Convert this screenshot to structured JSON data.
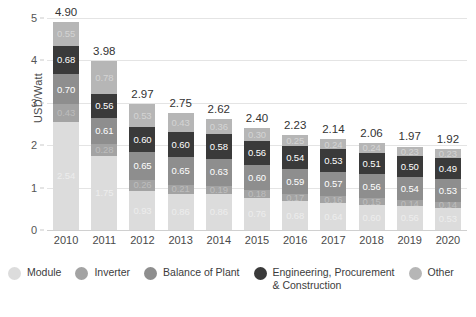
{
  "chart_data": {
    "type": "bar",
    "subtype": "stacked-bar",
    "title": "",
    "xlabel": "",
    "ylabel": "USD/Watt",
    "ylim": [
      0,
      5
    ],
    "yticks": [
      0,
      1,
      2,
      3,
      4,
      5
    ],
    "grid": true,
    "legend_position": "bottom",
    "categories": [
      "2010",
      "2011",
      "2012",
      "2013",
      "2014",
      "2015",
      "2016",
      "2017",
      "2018",
      "2019",
      "2020"
    ],
    "series": [
      {
        "name": "Module",
        "color": "#dcdcdc",
        "values": [
          2.54,
          1.75,
          0.93,
          0.86,
          0.86,
          0.76,
          0.68,
          0.64,
          0.6,
          0.56,
          0.53
        ]
      },
      {
        "name": "Inverter",
        "color": "#a3a3a3",
        "values": [
          0.43,
          0.28,
          0.26,
          0.21,
          0.19,
          0.18,
          0.17,
          0.16,
          0.15,
          0.14,
          0.14
        ]
      },
      {
        "name": "Balance of Plant",
        "color": "#8e8e8e",
        "values": [
          0.7,
          0.61,
          0.65,
          0.65,
          0.63,
          0.6,
          0.59,
          0.57,
          0.56,
          0.54,
          0.53
        ]
      },
      {
        "name": "Engineering, Procurement\n& Construction",
        "color": "#3a3a3a",
        "values": [
          0.68,
          0.56,
          0.6,
          0.6,
          0.58,
          0.56,
          0.54,
          0.53,
          0.51,
          0.5,
          0.49
        ]
      },
      {
        "name": "Other",
        "color": "#b6b6b6",
        "values": [
          0.55,
          0.78,
          0.53,
          0.43,
          0.36,
          0.3,
          0.25,
          0.24,
          0.24,
          0.23,
          0.23
        ]
      }
    ],
    "totals": [
      4.9,
      3.98,
      2.97,
      2.75,
      2.62,
      2.4,
      2.23,
      2.14,
      2.06,
      1.97,
      1.92
    ]
  },
  "axis": {
    "y_label": "USD/Watt",
    "y_tick_labels": [
      "0",
      "1",
      "2",
      "3",
      "4",
      "5"
    ],
    "x_tick_labels": [
      "2010",
      "2011",
      "2012",
      "2013",
      "2014",
      "2015",
      "2016",
      "2017",
      "2018",
      "2019",
      "2020"
    ]
  },
  "legend": {
    "items": [
      {
        "label": "Module",
        "color": "#dcdcdc"
      },
      {
        "label": "Inverter",
        "color": "#a3a3a3"
      },
      {
        "label": "Balance of Plant",
        "color": "#8e8e8e"
      },
      {
        "label": "Engineering, Procurement\n& Construction",
        "color": "#3a3a3a"
      },
      {
        "label": "Other",
        "color": "#b6b6b6"
      }
    ]
  },
  "colors": {
    "module": "#dcdcdc",
    "inverter": "#a3a3a3",
    "balance_of_plant": "#8e8e8e",
    "epc": "#3a3a3a",
    "other": "#b6b6b6",
    "gridline": "#e4e4e4",
    "text": "#3c3c3c",
    "background": "#ffffff"
  }
}
